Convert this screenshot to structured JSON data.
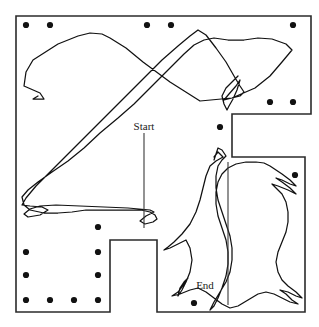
{
  "figure": {
    "width": 319,
    "height": 327,
    "background_color": "#ffffff"
  },
  "labels": {
    "start": "Start",
    "end": "End"
  },
  "style": {
    "boundary_color": "#2b2b2b",
    "boundary_width": 1.6,
    "trajectory_color": "#111111",
    "trajectory_width": 1.25,
    "pillar_color": "#121212",
    "pillar_radius": 3.1,
    "marker_color": "#3a3a3a",
    "label_color": "#1a1a1a",
    "label_font_size": 11
  },
  "chart_data": {
    "type": "line",
    "xlabel": "",
    "ylabel": "",
    "xlim": [
      0,
      319
    ],
    "ylim": [
      0,
      327
    ],
    "grid": false,
    "legend": "none",
    "annotations": [
      {
        "text": "Start",
        "x": 144,
        "y": 130,
        "marker_x": 144,
        "marker_y1": 133,
        "marker_y2": 228
      },
      {
        "text": "End",
        "x": 205,
        "y": 289,
        "marker_x": 228,
        "marker_y1": 162,
        "marker_y2": 305
      }
    ],
    "boundary": {
      "name": "floor-plan-outline",
      "closed": true,
      "points": [
        [
          16,
          16
        ],
        [
          311,
          16
        ],
        [
          311,
          114
        ],
        [
          232,
          114
        ],
        [
          232,
          157
        ],
        [
          305,
          157
        ],
        [
          305,
          312
        ],
        [
          157,
          312
        ],
        [
          157,
          240
        ],
        [
          110,
          240
        ],
        [
          110,
          312
        ],
        [
          16,
          312
        ]
      ]
    },
    "pillars": {
      "name": "pillar-columns",
      "radius": 3.1,
      "points": [
        [
          26,
          25
        ],
        [
          50,
          25
        ],
        [
          147,
          25
        ],
        [
          171,
          25
        ],
        [
          293,
          25
        ],
        [
          270,
          102
        ],
        [
          293,
          102
        ],
        [
          220,
          127
        ],
        [
          295,
          175
        ],
        [
          98,
          227
        ],
        [
          26,
          252
        ],
        [
          98,
          252
        ],
        [
          26,
          275
        ],
        [
          98,
          275
        ],
        [
          26,
          300
        ],
        [
          50,
          300
        ],
        [
          74,
          300
        ],
        [
          98,
          300
        ],
        [
          194,
          303
        ]
      ]
    },
    "series": [
      {
        "name": "trajectory",
        "points": [
          [
            38,
            96
          ],
          [
            33,
            99
          ],
          [
            44,
            99
          ],
          [
            40,
            93
          ],
          [
            24,
            86
          ],
          [
            26,
            72
          ],
          [
            33,
            60
          ],
          [
            58,
            44
          ],
          [
            78,
            36
          ],
          [
            90,
            33
          ],
          [
            102,
            34
          ],
          [
            110,
            38
          ],
          [
            126,
            48
          ],
          [
            143,
            62
          ],
          [
            170,
            82
          ],
          [
            200,
            101
          ],
          [
            232,
            98
          ],
          [
            255,
            88
          ],
          [
            270,
            76
          ],
          [
            282,
            62
          ],
          [
            292,
            50
          ],
          [
            286,
            44
          ],
          [
            272,
            39
          ],
          [
            258,
            38
          ],
          [
            244,
            40
          ],
          [
            228,
            40
          ],
          [
            214,
            38
          ],
          [
            204,
            40
          ],
          [
            194,
            45
          ],
          [
            184,
            54
          ],
          [
            172,
            66
          ],
          [
            160,
            78
          ],
          [
            148,
            90
          ],
          [
            134,
            104
          ],
          [
            118,
            118
          ],
          [
            100,
            133
          ],
          [
            84,
            148
          ],
          [
            68,
            161
          ],
          [
            52,
            172
          ],
          [
            38,
            182
          ],
          [
            28,
            190
          ],
          [
            22,
            197
          ],
          [
            24,
            205
          ],
          [
            30,
            210
          ],
          [
            44,
            213
          ],
          [
            58,
            213
          ],
          [
            72,
            212
          ],
          [
            86,
            210
          ],
          [
            100,
            210
          ],
          [
            114,
            210
          ],
          [
            128,
            210
          ],
          [
            141,
            210
          ],
          [
            150,
            212
          ],
          [
            155,
            215
          ],
          [
            157,
            219
          ],
          [
            153,
            222
          ],
          [
            145,
            224
          ],
          [
            140,
            221
          ],
          [
            146,
            216
          ],
          [
            154,
            212
          ],
          [
            150,
            210
          ],
          [
            128,
            208
          ],
          [
            104,
            207
          ],
          [
            80,
            206
          ],
          [
            56,
            205
          ],
          [
            40,
            206
          ],
          [
            30,
            209
          ],
          [
            24,
            214
          ],
          [
            28,
            217
          ],
          [
            40,
            215
          ],
          [
            48,
            210
          ],
          [
            42,
            207
          ],
          [
            30,
            206
          ],
          [
            22,
            205
          ],
          [
            26,
            198
          ],
          [
            36,
            186
          ],
          [
            50,
            172
          ],
          [
            66,
            156
          ],
          [
            82,
            140
          ],
          [
            98,
            124
          ],
          [
            114,
            108
          ],
          [
            130,
            92
          ],
          [
            146,
            76
          ],
          [
            162,
            60
          ],
          [
            178,
            46
          ],
          [
            190,
            36
          ],
          [
            198,
            30
          ],
          [
            206,
            35
          ],
          [
            216,
            48
          ],
          [
            226,
            62
          ],
          [
            234,
            76
          ],
          [
            240,
            86
          ],
          [
            244,
            92
          ],
          [
            240,
            96
          ],
          [
            232,
            98
          ],
          [
            224,
            100
          ],
          [
            229,
            94
          ],
          [
            236,
            86
          ],
          [
            240,
            80
          ],
          [
            237,
            90
          ],
          [
            233,
            99
          ],
          [
            229,
            106
          ],
          [
            227,
            110
          ],
          [
            224,
            104
          ],
          [
            222,
            96
          ],
          [
            226,
            88
          ],
          [
            232,
            82
          ],
          [
            238,
            76
          ]
        ]
      },
      {
        "name": "trajectory-lower",
        "points": [
          [
            214,
            157
          ],
          [
            218,
            152
          ],
          [
            223,
            157
          ],
          [
            216,
            161
          ],
          [
            210,
            166
          ],
          [
            206,
            176
          ],
          [
            203,
            188
          ],
          [
            200,
            200
          ],
          [
            196,
            212
          ],
          [
            190,
            224
          ],
          [
            182,
            234
          ],
          [
            174,
            242
          ],
          [
            168,
            247
          ],
          [
            164,
            250
          ],
          [
            170,
            248
          ],
          [
            178,
            244
          ],
          [
            186,
            240
          ],
          [
            190,
            248
          ],
          [
            192,
            260
          ],
          [
            190,
            272
          ],
          [
            186,
            282
          ],
          [
            182,
            290
          ],
          [
            178,
            296
          ],
          [
            180,
            288
          ],
          [
            184,
            282
          ],
          [
            188,
            278
          ],
          [
            184,
            284
          ],
          [
            178,
            292
          ],
          [
            172,
            296
          ],
          [
            180,
            294
          ],
          [
            190,
            290
          ],
          [
            198,
            288
          ],
          [
            206,
            292
          ],
          [
            214,
            298
          ],
          [
            222,
            304
          ],
          [
            230,
            308
          ],
          [
            238,
            306
          ],
          [
            248,
            300
          ],
          [
            258,
            294
          ],
          [
            266,
            292
          ],
          [
            274,
            294
          ],
          [
            282,
            298
          ],
          [
            290,
            302
          ],
          [
            298,
            304
          ],
          [
            292,
            300
          ],
          [
            286,
            294
          ],
          [
            280,
            290
          ],
          [
            288,
            292
          ],
          [
            296,
            296
          ],
          [
            302,
            298
          ],
          [
            296,
            292
          ],
          [
            288,
            286
          ],
          [
            282,
            280
          ],
          [
            278,
            272
          ],
          [
            276,
            262
          ],
          [
            278,
            252
          ],
          [
            282,
            242
          ],
          [
            286,
            232
          ],
          [
            288,
            222
          ],
          [
            288,
            212
          ],
          [
            286,
            202
          ],
          [
            282,
            194
          ],
          [
            276,
            188
          ],
          [
            272,
            184
          ],
          [
            278,
            186
          ],
          [
            288,
            190
          ],
          [
            296,
            194
          ],
          [
            290,
            188
          ],
          [
            282,
            182
          ],
          [
            276,
            178
          ],
          [
            282,
            180
          ],
          [
            290,
            184
          ],
          [
            296,
            186
          ],
          [
            290,
            180
          ],
          [
            282,
            174
          ],
          [
            276,
            170
          ],
          [
            270,
            166
          ],
          [
            264,
            163
          ],
          [
            256,
            162
          ],
          [
            246,
            162
          ],
          [
            236,
            164
          ],
          [
            228,
            168
          ],
          [
            222,
            174
          ],
          [
            218,
            182
          ],
          [
            216,
            192
          ],
          [
            216,
            204
          ],
          [
            218,
            216
          ],
          [
            222,
            228
          ],
          [
            226,
            240
          ],
          [
            228,
            252
          ],
          [
            228,
            264
          ],
          [
            226,
            276
          ],
          [
            222,
            288
          ],
          [
            218,
            298
          ],
          [
            214,
            306
          ],
          [
            210,
            310
          ],
          [
            214,
            302
          ],
          [
            220,
            292
          ],
          [
            226,
            282
          ],
          [
            230,
            272
          ],
          [
            232,
            260
          ],
          [
            232,
            248
          ],
          [
            230,
            236
          ],
          [
            226,
            224
          ],
          [
            222,
            212
          ],
          [
            218,
            200
          ],
          [
            216,
            188
          ],
          [
            216,
            176
          ],
          [
            218,
            166
          ],
          [
            222,
            160
          ],
          [
            226,
            156
          ],
          [
            222,
            150
          ],
          [
            218,
            148
          ],
          [
            216,
            154
          ],
          [
            214,
            160
          ]
        ]
      }
    ]
  }
}
